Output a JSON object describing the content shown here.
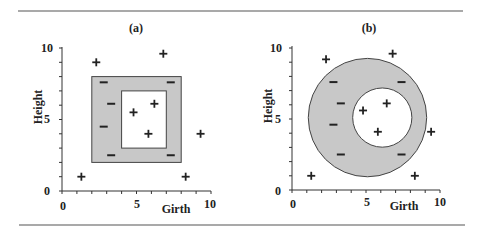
{
  "figure": {
    "rule_color": "#555555",
    "region_fill": "#c8c8c8",
    "panels": [
      {
        "id": "a",
        "label": "(a)",
        "x_label": "Girth",
        "y_label": "Height",
        "x_ticks": [
          "0",
          "5",
          "10"
        ],
        "y_ticks": [
          "0",
          "5",
          "10"
        ],
        "shape": "square-ring",
        "outer_rect": {
          "x0": 2,
          "x1": 8,
          "y0": 2,
          "y1": 8
        },
        "inner_rect": {
          "x0": 4,
          "x1": 7,
          "y0": 3,
          "y1": 7
        }
      },
      {
        "id": "b",
        "label": "(b)",
        "x_label": "Girth",
        "y_label": "Height",
        "x_ticks": [
          "0",
          "5",
          "10"
        ],
        "y_ticks": [
          "0",
          "5",
          "10"
        ],
        "shape": "circular-ring",
        "outer_circle": {
          "cx": 5.1,
          "cy": 5.1,
          "r": 4.0
        },
        "inner_circle": {
          "cx": 6.1,
          "cy": 5.1,
          "r": 2.0
        }
      }
    ]
  },
  "chart_data": [
    {
      "type": "scatter",
      "title": "(a)",
      "xlabel": "Girth",
      "ylabel": "Height",
      "xlim": [
        0,
        10
      ],
      "ylim": [
        0,
        10
      ],
      "region": "rectangular ring: outer [2,8]x[2,8], inner [4,7]x[3,7]",
      "series": [
        {
          "name": "+",
          "points": [
            [
              2.3,
              9.0
            ],
            [
              6.8,
              9.6
            ],
            [
              4.8,
              5.5
            ],
            [
              6.2,
              6.1
            ],
            [
              5.8,
              4.0
            ],
            [
              9.3,
              4.0
            ],
            [
              1.3,
              1.0
            ],
            [
              8.3,
              1.0
            ]
          ]
        },
        {
          "name": "-",
          "points": [
            [
              2.8,
              7.6
            ],
            [
              7.3,
              7.6
            ],
            [
              3.3,
              6.1
            ],
            [
              2.8,
              4.5
            ],
            [
              3.3,
              2.5
            ],
            [
              7.3,
              2.5
            ]
          ]
        }
      ]
    },
    {
      "type": "scatter",
      "title": "(b)",
      "xlabel": "Girth",
      "ylabel": "Height",
      "xlim": [
        0,
        10
      ],
      "ylim": [
        0,
        10
      ],
      "region": "circular ring: outer circle center (5.1,5.1) r 4.0, inner circle center (6.1,5.1) r 2.0",
      "series": [
        {
          "name": "+",
          "points": [
            [
              2.3,
              9.2
            ],
            [
              6.8,
              9.6
            ],
            [
              4.8,
              5.6
            ],
            [
              6.4,
              6.1
            ],
            [
              5.8,
              4.1
            ],
            [
              9.4,
              4.1
            ],
            [
              1.3,
              1.0
            ],
            [
              8.3,
              1.0
            ]
          ]
        },
        {
          "name": "-",
          "points": [
            [
              2.8,
              7.6
            ],
            [
              7.4,
              7.6
            ],
            [
              3.3,
              6.1
            ],
            [
              2.8,
              4.6
            ],
            [
              3.3,
              2.5
            ],
            [
              7.4,
              2.5
            ]
          ]
        }
      ]
    }
  ]
}
